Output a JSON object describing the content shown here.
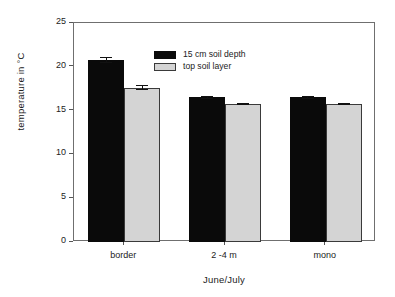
{
  "chart_data": {
    "type": "bar",
    "title": "",
    "xlabel": "June/July",
    "ylabel": "temperature in °C",
    "categories": [
      "border",
      "2 -4 m",
      "mono"
    ],
    "series": [
      {
        "name": "15 cm soil depth",
        "color": "#0a0a0a",
        "values": [
          20.8,
          16.5,
          16.5
        ],
        "errors": [
          0.35,
          0.15,
          0.12
        ]
      },
      {
        "name": "top soil layer",
        "color": "#d4d4d4",
        "values": [
          17.6,
          15.75,
          15.8
        ],
        "errors": [
          0.3,
          0.12,
          0.12
        ]
      }
    ],
    "ylim": [
      0,
      25
    ],
    "yticks": [
      0,
      5,
      10,
      15,
      20,
      25
    ],
    "ytick_labels": [
      "0",
      "5",
      "10",
      "15",
      "20",
      "25"
    ],
    "grid": false,
    "legend_position": "top-left",
    "frame": true
  },
  "axes": {
    "y_title": "temperature in °C",
    "x_title": "June/July"
  },
  "legend": {
    "entries": [
      {
        "label": "15 cm soil depth",
        "swatch": "dark"
      },
      {
        "label": "top soil layer",
        "swatch": "light"
      }
    ]
  }
}
